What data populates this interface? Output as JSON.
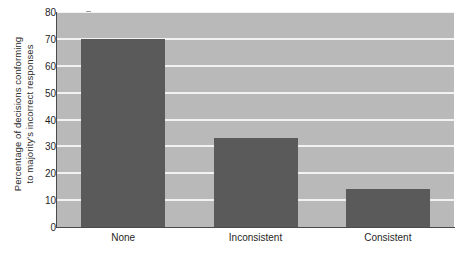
{
  "chart_data": {
    "type": "bar",
    "title": "",
    "subtitle": "",
    "categories": [
      "None",
      "Inconsistent",
      "Consistent"
    ],
    "values": [
      70,
      33,
      14
    ],
    "xlabel": "",
    "ylabel_lines": [
      "Percentage of decisions conforming",
      "to majority's incorrect responses"
    ],
    "ylabel": "Percentage of decisions conforming to majority's incorrect responses",
    "ylim": [
      0,
      80
    ],
    "ytick_step": 10,
    "yticks": [
      0,
      10,
      20,
      30,
      40,
      50,
      60,
      70,
      80
    ],
    "grid": true,
    "grid_axis": "y",
    "legend": false,
    "legend_position": "none",
    "colors": {
      "bar": "#5a5a5a",
      "plot_background": "#b9b9b9",
      "gridline": "#f2f2f2",
      "axis": "#4a4a4a",
      "page_background": "#ffffff",
      "text": "#1f1f1f"
    }
  }
}
